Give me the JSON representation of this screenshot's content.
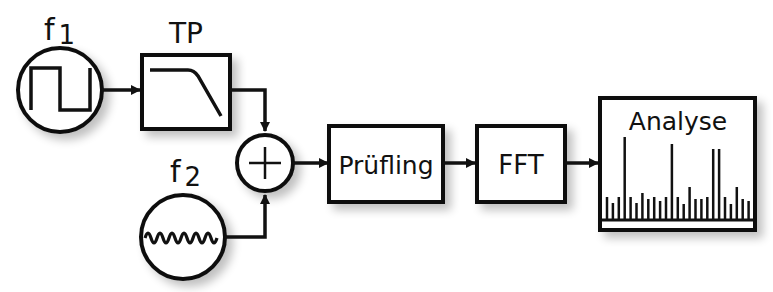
{
  "diagram": {
    "sources": [
      {
        "id": "f1",
        "label": "f",
        "subscript": "1",
        "waveform": "square-wave"
      },
      {
        "id": "f2",
        "label": "f",
        "subscript": "2",
        "waveform": "sine-wave"
      }
    ],
    "blocks": {
      "lowpass": {
        "label": "TP",
        "icon": "lowpass-filter-curve"
      },
      "sum": {
        "symbol": "+"
      },
      "dut": {
        "label": "Prüfling"
      },
      "fft": {
        "label": "FFT"
      },
      "analysis": {
        "label": "Analyse",
        "icon": "spectrum-bars"
      }
    },
    "connections": [
      {
        "from": "f1",
        "to": "lowpass"
      },
      {
        "from": "lowpass",
        "to": "sum"
      },
      {
        "from": "f2",
        "to": "sum"
      },
      {
        "from": "sum",
        "to": "dut"
      },
      {
        "from": "dut",
        "to": "fft"
      },
      {
        "from": "fft",
        "to": "analysis"
      }
    ],
    "spectrum_heights": [
      22,
      16,
      22,
      82,
      22,
      16,
      26,
      20,
      22,
      18,
      22,
      75,
      22,
      15,
      32,
      20,
      20,
      22,
      70,
      70,
      22,
      15,
      32,
      20,
      18
    ]
  }
}
